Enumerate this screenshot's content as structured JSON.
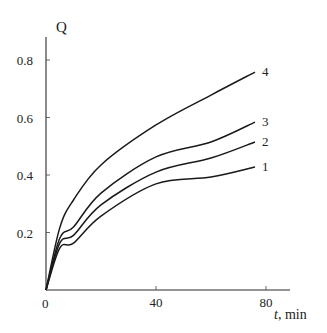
{
  "chart_data": {
    "type": "line",
    "title": "",
    "xlabel_var": "t",
    "xlabel_unit": ", min",
    "ylabel": "Q",
    "xlim": [
      0,
      88
    ],
    "ylim": [
      0,
      0.88
    ],
    "x_ticks": [
      0,
      40,
      80
    ],
    "x_tick_labels": [
      "0",
      "40",
      "80"
    ],
    "y_ticks": [
      0.2,
      0.4,
      0.6,
      0.8
    ],
    "y_tick_labels": [
      "0.2",
      "0.4",
      "0.6",
      "0.8"
    ],
    "origin_label": "0",
    "grid": false,
    "legend": "inline labels at right end of curves",
    "x": [
      0,
      5,
      10,
      20,
      40,
      60,
      76
    ],
    "series": [
      {
        "name": "1",
        "values": [
          0,
          0.146,
          0.163,
          0.257,
          0.369,
          0.393,
          0.428
        ]
      },
      {
        "name": "2",
        "values": [
          0,
          0.163,
          0.19,
          0.296,
          0.41,
          0.459,
          0.515
        ]
      },
      {
        "name": "3",
        "values": [
          0,
          0.18,
          0.219,
          0.337,
          0.463,
          0.515,
          0.584
        ]
      },
      {
        "name": "4",
        "values": [
          0,
          0.216,
          0.313,
          0.435,
          0.574,
          0.678,
          0.758
        ]
      }
    ]
  }
}
